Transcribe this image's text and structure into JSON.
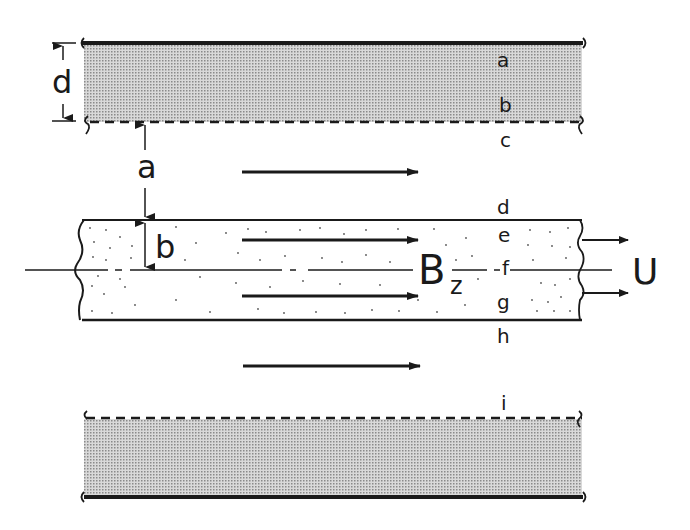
{
  "figure": {
    "colors": {
      "ink": "#1a1a1a",
      "shade": "#bdbdbd",
      "background": "#ffffff"
    },
    "dimension_labels": {
      "d": "d",
      "a": "a",
      "b": "b"
    },
    "field_label": {
      "main": "B",
      "subscript": "z"
    },
    "velocity_label": "U",
    "position_labels": [
      "a",
      "b",
      "c",
      "d",
      "e",
      "f",
      "g",
      "h",
      "i"
    ],
    "flow_arrows": [
      {
        "region": "upper-gap",
        "y": 172
      },
      {
        "region": "slab-upper",
        "y": 240
      },
      {
        "region": "slab-lower",
        "y": 296
      },
      {
        "region": "lower-gap",
        "y": 366
      }
    ],
    "slab_velocity_arrows": 2
  }
}
